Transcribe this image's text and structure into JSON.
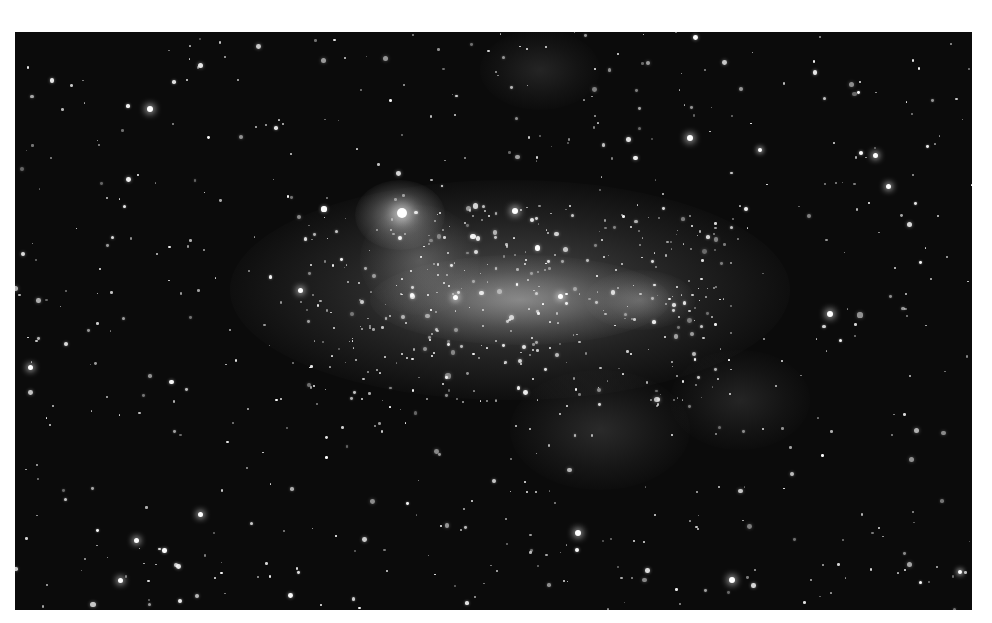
{
  "image": {
    "subject": "Large Magellanic Cloud (grayscale star field)",
    "frame": {
      "left": 15,
      "top": 32,
      "width": 957,
      "height": 578
    },
    "background_color": "#0b0b0b",
    "page_color": "#ffffff",
    "nebula_glows": [
      {
        "x": 510,
        "y": 290,
        "w": 560,
        "h": 220,
        "opacity": 0.3
      },
      {
        "x": 520,
        "y": 300,
        "w": 300,
        "h": 90,
        "opacity": 0.45
      },
      {
        "x": 400,
        "y": 215,
        "w": 90,
        "h": 70,
        "opacity": 0.55
      },
      {
        "x": 640,
        "y": 300,
        "w": 110,
        "h": 60,
        "opacity": 0.3
      },
      {
        "x": 420,
        "y": 260,
        "w": 120,
        "h": 110,
        "opacity": 0.25
      },
      {
        "x": 600,
        "y": 430,
        "w": 180,
        "h": 120,
        "opacity": 0.15
      },
      {
        "x": 740,
        "y": 400,
        "w": 140,
        "h": 100,
        "opacity": 0.12
      },
      {
        "x": 540,
        "y": 70,
        "w": 120,
        "h": 80,
        "opacity": 0.12
      }
    ],
    "bright_stars": [
      {
        "x": 402,
        "y": 213,
        "r": 5
      },
      {
        "x": 150,
        "y": 109,
        "r": 3
      },
      {
        "x": 690,
        "y": 138,
        "r": 3
      },
      {
        "x": 830,
        "y": 314,
        "r": 3
      },
      {
        "x": 578,
        "y": 533,
        "r": 3
      },
      {
        "x": 732,
        "y": 580,
        "r": 3
      },
      {
        "x": 515,
        "y": 211,
        "r": 3
      },
      {
        "x": 455,
        "y": 297,
        "r": 2.5
      },
      {
        "x": 30,
        "y": 367,
        "r": 2.5
      },
      {
        "x": 888,
        "y": 186,
        "r": 2.5
      },
      {
        "x": 875,
        "y": 155,
        "r": 2.5
      },
      {
        "x": 136,
        "y": 540,
        "r": 2.5
      },
      {
        "x": 120,
        "y": 580,
        "r": 2.5
      },
      {
        "x": 300,
        "y": 290,
        "r": 2.5
      },
      {
        "x": 560,
        "y": 296,
        "r": 2.5
      },
      {
        "x": 960,
        "y": 572,
        "r": 2
      },
      {
        "x": 200,
        "y": 514,
        "r": 2.5
      },
      {
        "x": 760,
        "y": 150,
        "r": 2
      }
    ],
    "star_field_seed": 1337,
    "star_field_count": 900
  }
}
